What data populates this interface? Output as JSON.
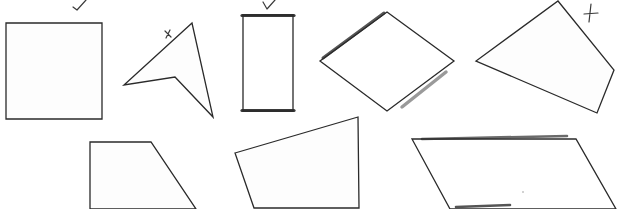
{
  "figure": {
    "background": "#ffffff",
    "stroke_color": "#2a2a2a",
    "shapes": [
      {
        "id": "square",
        "label": "square",
        "points": "6,23 102,23 102,119 6,119",
        "annotation": "checkmark"
      },
      {
        "id": "concave-dart",
        "label": "concave quadrilateral (dart)",
        "points": "192,23 124,85 175,77 213,117",
        "annotation": "x"
      },
      {
        "id": "rectangle",
        "label": "rectangle",
        "points": "243,15 293,15 293,111 243,111",
        "annotation": "checkmark",
        "highlighted_edges": [
          "top",
          "bottom"
        ]
      },
      {
        "id": "rhombus",
        "label": "rhombus",
        "points": "387,12 454,61 387,111 320,61",
        "annotation": null,
        "highlighted_edges": [
          "upper-left",
          "lower-right"
        ]
      },
      {
        "id": "kite",
        "label": "irregular quadrilateral",
        "points": "558,1 614,70 597,113 476,61",
        "annotation": "x"
      },
      {
        "id": "trapezoid",
        "label": "right trapezoid",
        "points": "90,142 151,142 196,209 90,209",
        "annotation": null
      },
      {
        "id": "irregular-quad",
        "label": "irregular quadrilateral",
        "points": "235,153 358,117 359,208 254,208",
        "annotation": null
      },
      {
        "id": "parallelogram",
        "label": "parallelogram",
        "points": "412,139 576,139 616,209 450,209",
        "annotation": null,
        "highlighted_edges": [
          "top",
          "bottom"
        ]
      }
    ],
    "annotations": [
      {
        "type": "checkmark",
        "target": "square",
        "path": "M73,7 L77,10 L86,0"
      },
      {
        "type": "x",
        "target": "concave-dart",
        "path": "M165,31 L171,37 M170,30 L166,38"
      },
      {
        "type": "checkmark",
        "target": "rectangle",
        "path": "M263,2 L267,9 L275,0"
      },
      {
        "type": "x",
        "target": "kite",
        "path": "M591,4 L589,22 M584,14 L598,13"
      }
    ]
  }
}
